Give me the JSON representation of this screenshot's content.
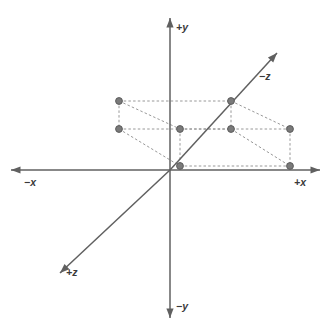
{
  "figure": {
    "background_color": "#ffffff",
    "axis_color": "#606060",
    "dash_color": "#8c8c8c",
    "point_color": "#7a7a7a",
    "point_stroke_color": "#5c5c5c",
    "label_color": "#3a3a3a",
    "origin": {
      "x": 170,
      "y": 170
    }
  },
  "axes": [
    {
      "name": "positive-y-axis",
      "label": "+y",
      "from": {
        "x": 170,
        "y": 170
      },
      "to": {
        "x": 170,
        "y": 18
      },
      "label_pos": {
        "x": 176,
        "y": 21
      },
      "arrow": true
    },
    {
      "name": "negative-y-axis",
      "label": "−y",
      "from": {
        "x": 170,
        "y": 170
      },
      "to": {
        "x": 170,
        "y": 318
      },
      "label_pos": {
        "x": 176,
        "y": 300
      },
      "arrow": true
    },
    {
      "name": "positive-x-axis",
      "label": "+x",
      "from": {
        "x": 170,
        "y": 170
      },
      "to": {
        "x": 320,
        "y": 170
      },
      "label_pos": {
        "x": 294,
        "y": 176
      },
      "arrow": true
    },
    {
      "name": "negative-x-axis",
      "label": "−x",
      "from": {
        "x": 170,
        "y": 170
      },
      "to": {
        "x": 11,
        "y": 170
      },
      "label_pos": {
        "x": 24,
        "y": 176
      },
      "arrow": true
    },
    {
      "name": "negative-z-axis",
      "label": "−z",
      "from": {
        "x": 170,
        "y": 170
      },
      "to": {
        "x": 277,
        "y": 53
      },
      "label_pos": {
        "x": 259,
        "y": 70
      },
      "arrow": true
    },
    {
      "name": "positive-z-axis",
      "label": "+z",
      "from": {
        "x": 170,
        "y": 170
      },
      "to": {
        "x": 60,
        "y": 273
      },
      "label_pos": {
        "x": 66,
        "y": 266
      },
      "arrow": true
    }
  ],
  "chart_data": {
    "type": "scatter",
    "xlabel": "x",
    "ylabel": "y",
    "zlabel": "z",
    "projection": "oblique",
    "grid": false,
    "legend": null,
    "points": [
      {
        "id": "p1",
        "name": "back-top-left",
        "x": 119,
        "y": 101
      },
      {
        "id": "p2",
        "name": "back-bottom-left",
        "x": 119,
        "y": 129
      },
      {
        "id": "p3",
        "name": "back-top-right",
        "x": 231,
        "y": 101
      },
      {
        "id": "p4",
        "name": "back-bottom-right",
        "x": 231,
        "y": 129
      },
      {
        "id": "p5",
        "name": "front-top-left",
        "x": 180,
        "y": 129
      },
      {
        "id": "p6",
        "name": "front-bottom-left",
        "x": 180,
        "y": 166
      },
      {
        "id": "p7",
        "name": "front-top-right",
        "x": 290,
        "y": 129
      },
      {
        "id": "p8",
        "name": "front-bottom-right",
        "x": 290,
        "y": 166
      }
    ],
    "edges": [
      {
        "from": "p1",
        "to": "p3"
      },
      {
        "from": "p2",
        "to": "p4"
      },
      {
        "from": "p1",
        "to": "p2"
      },
      {
        "from": "p3",
        "to": "p4"
      },
      {
        "from": "p5",
        "to": "p7"
      },
      {
        "from": "p6",
        "to": "p8"
      },
      {
        "from": "p5",
        "to": "p6"
      },
      {
        "from": "p7",
        "to": "p8"
      },
      {
        "from": "p1",
        "to": "p5"
      },
      {
        "from": "p2",
        "to": "p6"
      },
      {
        "from": "p3",
        "to": "p7"
      },
      {
        "from": "p4",
        "to": "p8"
      }
    ]
  }
}
